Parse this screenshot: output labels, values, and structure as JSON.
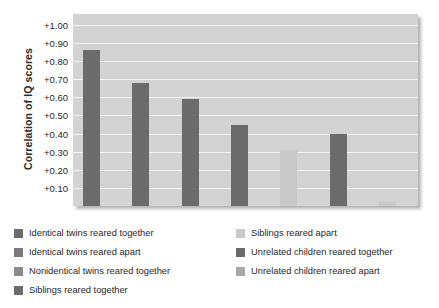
{
  "chart_data": {
    "type": "bar",
    "title": "",
    "xlabel": "",
    "ylabel": "Correlation of IQ scores",
    "ylim": [
      0,
      1.06
    ],
    "grid": true,
    "legend_position": "bottom",
    "categories": [
      "Identical twins reared together",
      "Identical twins reared apart",
      "Nonidentical twins reared together",
      "Siblings reared together",
      "Siblings reared apart",
      "Unrelated children reared together",
      "Unrelated children reared apart"
    ],
    "values": [
      0.86,
      0.68,
      0.59,
      0.45,
      0.31,
      0.4,
      0.02
    ],
    "bar_colors": [
      "#6b6b6b",
      "#6b6b6b",
      "#6b6b6b",
      "#6b6b6b",
      "#c9c9c9",
      "#6b6b6b",
      "#c9c9c9"
    ],
    "ytick_labels": [
      "+1.00",
      "+0.90",
      "+0.80",
      "+0.70",
      "+0.60",
      "+0.50",
      "+0.40",
      "+0.30",
      "+0.20",
      "+0.10"
    ],
    "ytick_values": [
      1.0,
      0.9,
      0.8,
      0.7,
      0.6,
      0.5,
      0.4,
      0.3,
      0.2,
      0.1
    ],
    "xtick_labels": []
  },
  "legend": {
    "left_column": [
      {
        "label": "Identical twins reared together",
        "color": "#6b6b6b"
      },
      {
        "label": "Identical twins reared apart",
        "color": "#7a7a7a"
      },
      {
        "label": "Nonidentical twins reared together",
        "color": "#8a8a8a"
      },
      {
        "label": "Siblings reared together",
        "color": "#6b6b6b"
      }
    ],
    "right_column": [
      {
        "label": "Siblings reared apart",
        "color": "#c9c9c9"
      },
      {
        "label": "Unrelated children reared together",
        "color": "#6b6b6b"
      },
      {
        "label": "Unrelated children reared apart",
        "color": "#a8a8a8"
      }
    ]
  },
  "colors": {
    "plot_background": "#d3d3d3",
    "gridline": "#f2f2f2",
    "bar_dark": "#6b6b6b",
    "bar_light": "#c9c9c9",
    "text": "#1f1f1f"
  }
}
